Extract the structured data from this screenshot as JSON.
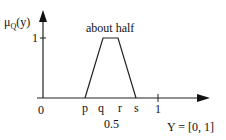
{
  "diagram": {
    "y_axis_label": "μQ(y)",
    "y_axis_label_main": "μ",
    "y_axis_label_sub": "Q",
    "y_axis_label_arg": "(y)",
    "y_tick_label": "1",
    "title": "about half",
    "origin_label": "0",
    "x_tick_labels": [
      "p",
      "q",
      "r",
      "s"
    ],
    "x_tick_one": "1",
    "center_value": "0.5",
    "domain_label": "Y = [0, 1]",
    "shape": "trapezoid",
    "points": {
      "p": 85,
      "q": 103,
      "r": 118,
      "s": 136
    }
  }
}
